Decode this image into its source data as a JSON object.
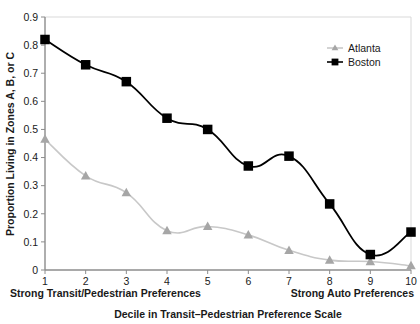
{
  "chart_data": {
    "type": "line",
    "title": "",
    "xlabel": "Decile in Transit–Pedestrian Preference Scale",
    "ylabel": "Proportion Living in Zones A, B, or C",
    "categories": [
      "1",
      "2",
      "3",
      "4",
      "5",
      "6",
      "7",
      "8",
      "9",
      "10"
    ],
    "x": [
      1,
      2,
      3,
      4,
      5,
      6,
      7,
      8,
      9,
      10
    ],
    "xlim": [
      1,
      10
    ],
    "ylim": [
      0,
      0.9
    ],
    "grid": true,
    "grid_note": "single horizontal gridline at y = 0.9 (top)",
    "legend_position": "top-right",
    "series": [
      {
        "name": "Atlanta",
        "color": "#c8c8c8",
        "marker": "triangle",
        "values": [
          0.465,
          0.335,
          0.275,
          0.14,
          0.155,
          0.125,
          0.07,
          0.035,
          0.03,
          0.015
        ]
      },
      {
        "name": "Boston",
        "color": "#000000",
        "marker": "square",
        "values": [
          0.82,
          0.73,
          0.67,
          0.54,
          0.5,
          0.37,
          0.405,
          0.235,
          0.055,
          0.135
        ]
      }
    ],
    "ytick_labels": [
      "0",
      "0.1",
      "0.2",
      "0.3",
      "0.4",
      "0.5",
      "0.6",
      "0.7",
      "0.8",
      "0.9"
    ],
    "ytick_values": [
      0,
      0.1,
      0.2,
      0.3,
      0.4,
      0.5,
      0.6,
      0.7,
      0.8,
      0.9
    ],
    "xtick_labels": [
      "1",
      "2",
      "3",
      "4",
      "5",
      "6",
      "7",
      "8",
      "9",
      "10"
    ],
    "annotations": [
      {
        "name": "left-end-label",
        "text": "Strong Transit/Pedestrian Preferences"
      },
      {
        "name": "right-end-label",
        "text": "Strong Auto Preferences"
      }
    ]
  },
  "legend": {
    "items": [
      {
        "label": "Atlanta",
        "color": "#c8c8c8",
        "marker": "triangle"
      },
      {
        "label": "Boston",
        "color": "#000000",
        "marker": "square"
      }
    ]
  },
  "axis_colors": {
    "axis_line": "#8c8c8c",
    "grid_line": "#d9d9d9",
    "atlanta": "#c8c8c8",
    "atlanta_marker": "#a6a6a6",
    "boston": "#000000"
  }
}
